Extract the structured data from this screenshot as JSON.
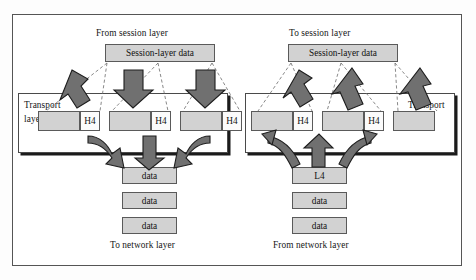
{
  "diagram": {
    "title_left": "From session layer",
    "title_right": "To session layer",
    "left": {
      "session_box": "Session-layer data",
      "layer_label_line1": "Transport",
      "layer_label_line2": "layer",
      "segments": [
        {
          "data": "",
          "header": "H4"
        },
        {
          "data": "",
          "header": "H4"
        },
        {
          "data": "",
          "header": "H4"
        }
      ],
      "network_boxes": [
        "data",
        "data",
        "data"
      ],
      "network_caption": "To network layer"
    },
    "right": {
      "session_box": "Session-layer data",
      "layer_label_line1": "Transport",
      "layer_label_line2": "layer",
      "segments": [
        {
          "data": "",
          "header": "H4"
        },
        {
          "data": "",
          "header": "H4"
        },
        {
          "data": "",
          "header": "H4"
        }
      ],
      "network_boxes": [
        "L4",
        "data",
        "data"
      ],
      "network_caption": "From network layer"
    }
  },
  "colors": {
    "box_fill": "#d2d2d2",
    "box_stroke": "#5a5a5a",
    "arrow_fill": "#707070",
    "arrow_stroke": "#1d1d1d",
    "frame": "#555555"
  }
}
